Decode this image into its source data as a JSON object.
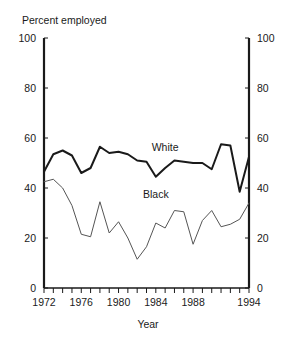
{
  "chart_data": {
    "type": "line",
    "title": "",
    "ylabel": "Percent employed",
    "xlabel": "Year",
    "ylim": [
      0,
      100
    ],
    "xlim": [
      1972,
      1994
    ],
    "grid": false,
    "legend": "inline-labels",
    "y_ticks": [
      0,
      20,
      40,
      60,
      80,
      100
    ],
    "y_tick_labels": [
      "0",
      "20",
      "40",
      "60",
      "80",
      "100"
    ],
    "y_axis_both_sides": true,
    "x_ticks": [
      1972,
      1973,
      1974,
      1975,
      1976,
      1977,
      1978,
      1979,
      1980,
      1981,
      1982,
      1983,
      1984,
      1985,
      1986,
      1987,
      1988,
      1989,
      1990,
      1991,
      1992,
      1993,
      1994
    ],
    "x_tick_labels_shown": [
      "1972",
      "1976",
      "1980",
      "1984",
      "1988",
      "1994"
    ],
    "x_labeled_years": [
      1972,
      1976,
      1980,
      1984,
      1988,
      1994
    ],
    "x": [
      1972,
      1973,
      1974,
      1975,
      1976,
      1977,
      1978,
      1979,
      1980,
      1981,
      1982,
      1983,
      1984,
      1985,
      1986,
      1987,
      1988,
      1989,
      1990,
      1991,
      1992,
      1993,
      1994
    ],
    "series": [
      {
        "name": "White",
        "color": "#1a1a1a",
        "line_width": 2.0,
        "label_x": 1985,
        "label_y": 55,
        "values": [
          46.5,
          53.5,
          55.0,
          53.0,
          46.0,
          48.0,
          56.5,
          54.0,
          54.5,
          53.5,
          51.0,
          50.5,
          44.5,
          48.0,
          51.0,
          50.5,
          50.0,
          50.0,
          47.5,
          57.5,
          57.0,
          38.5,
          52.5
        ]
      },
      {
        "name": "Black",
        "color": "#555555",
        "line_width": 1.0,
        "label_x": 1984,
        "label_y": 36,
        "values": [
          42.5,
          43.5,
          40.0,
          33.0,
          21.5,
          20.5,
          34.5,
          22.0,
          26.5,
          20.0,
          11.5,
          16.5,
          26.0,
          24.0,
          31.0,
          30.5,
          17.5,
          27.0,
          31.0,
          24.5,
          25.5,
          27.5,
          34.0
        ]
      }
    ]
  },
  "labels": {
    "y_axis_title": "Percent employed",
    "x_axis_title": "Year",
    "series_white": "White",
    "series_black": "Black"
  }
}
